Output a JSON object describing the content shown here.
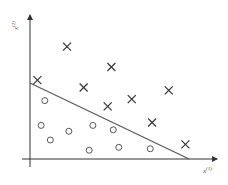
{
  "chart_data": {
    "type": "scatter",
    "title": "",
    "xlabel": "x",
    "xlabel_sup": "(1)",
    "ylabel": "x",
    "ylabel_sup": "(2)",
    "xlim": [
      0,
      10
    ],
    "ylim": [
      0,
      10
    ],
    "grid": false,
    "series": [
      {
        "name": "positive",
        "marker": "cross",
        "points": [
          [
            0.4,
            5.4
          ],
          [
            2.0,
            7.7
          ],
          [
            4.4,
            6.3
          ],
          [
            2.9,
            4.9
          ],
          [
            4.2,
            3.6
          ],
          [
            5.5,
            4.1
          ],
          [
            7.5,
            4.7
          ],
          [
            6.6,
            2.5
          ],
          [
            8.4,
            1.0
          ]
        ]
      },
      {
        "name": "negative",
        "marker": "circle",
        "points": [
          [
            0.8,
            4.0
          ],
          [
            0.6,
            2.3
          ],
          [
            1.1,
            1.3
          ],
          [
            2.1,
            1.9
          ],
          [
            3.4,
            2.3
          ],
          [
            4.5,
            2.0
          ],
          [
            3.2,
            0.6
          ],
          [
            4.8,
            0.8
          ],
          [
            6.5,
            0.7
          ]
        ]
      }
    ],
    "decision_boundary": {
      "from": [
        0,
        5.2
      ],
      "to": [
        8.6,
        0
      ]
    }
  },
  "colors": {
    "ink": "#333333",
    "background": "#ffffff"
  }
}
